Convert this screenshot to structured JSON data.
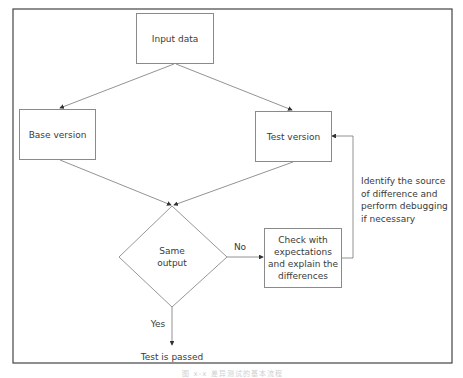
{
  "diagram": {
    "type": "flowchart",
    "nodes": {
      "input": {
        "label": "Input data",
        "shape": "rectangle"
      },
      "base": {
        "label": "Base version",
        "shape": "rectangle"
      },
      "test": {
        "label": "Test version",
        "shape": "rectangle"
      },
      "decision": {
        "label": "Same\noutput",
        "shape": "diamond"
      },
      "check": {
        "label": "Check with\nexpectations\nand explain the\ndifferences",
        "shape": "rectangle"
      },
      "passed": {
        "label": "Test is passed",
        "shape": "text"
      }
    },
    "edges": [
      {
        "from": "input",
        "to": "base",
        "label": ""
      },
      {
        "from": "input",
        "to": "test",
        "label": ""
      },
      {
        "from": "base",
        "to": "decision",
        "label": ""
      },
      {
        "from": "test",
        "to": "decision",
        "label": ""
      },
      {
        "from": "decision",
        "to": "check",
        "label": "No"
      },
      {
        "from": "decision",
        "to": "passed",
        "label": "Yes"
      },
      {
        "from": "check",
        "to": "test",
        "label": ""
      }
    ],
    "edge_labels": {
      "no": "No",
      "yes": "Yes"
    },
    "annotation": "Identify the source\nof difference and\nperform debugging\nif necessary",
    "caption": "图 x-x 差异测试的基本流程"
  }
}
